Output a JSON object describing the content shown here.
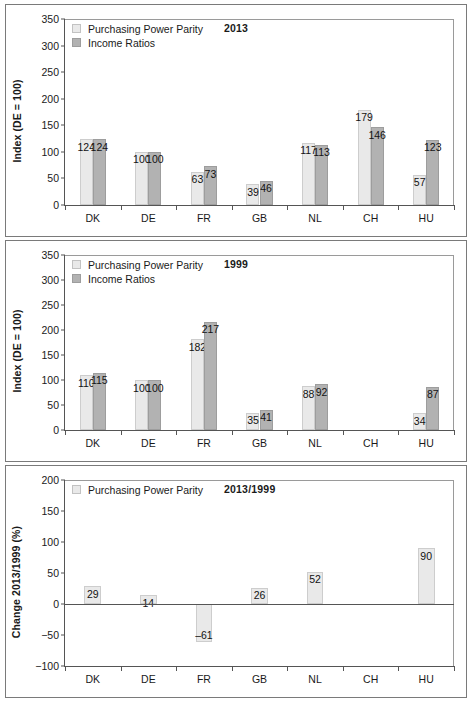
{
  "figure": {
    "panels": [
      {
        "id": "panel-2013",
        "title": "2013",
        "ylabel": "Index (DE = 100)",
        "yticks": [
          "0",
          "50",
          "100",
          "150",
          "200",
          "250",
          "300",
          "350"
        ],
        "legend": [
          {
            "label": "Purchasing Power Parity",
            "swatch": "light",
            "color": "#e9e9e9"
          },
          {
            "label": "Income Ratios",
            "swatch": "dark",
            "color": "#b2b2b2"
          }
        ]
      },
      {
        "id": "panel-1999",
        "title": "1999",
        "ylabel": "Index (DE = 100)",
        "yticks": [
          "0",
          "50",
          "100",
          "150",
          "200",
          "250",
          "300",
          "350"
        ],
        "legend": [
          {
            "label": "Purchasing Power Parity",
            "swatch": "light",
            "color": "#e9e9e9"
          },
          {
            "label": "Income Ratios",
            "swatch": "dark",
            "color": "#b2b2b2"
          }
        ]
      },
      {
        "id": "panel-change",
        "title": "2013/1999",
        "ylabel": "Change 2013/1999 (%)",
        "yticks": [
          "-100",
          "-50",
          "0",
          "50",
          "100",
          "150",
          "200"
        ],
        "legend": [
          {
            "label": "Purchasing Power Parity",
            "swatch": "light",
            "color": "#e9e9e9"
          }
        ]
      }
    ]
  },
  "chart_data": [
    {
      "type": "bar",
      "title": "2013",
      "xlabel": "",
      "ylabel": "Index (DE = 100)",
      "ylim": [
        0,
        350
      ],
      "ytick_step": 50,
      "grid": false,
      "legend_position": "top-left",
      "categories": [
        "DK",
        "DE",
        "FR",
        "GB",
        "NL",
        "CH",
        "HU"
      ],
      "series": [
        {
          "name": "Purchasing Power Parity",
          "color": "#e9e9e9",
          "values": [
            124,
            100,
            63,
            39,
            117,
            179,
            57
          ]
        },
        {
          "name": "Income Ratios",
          "color": "#b2b2b2",
          "values": [
            124,
            100,
            73,
            46,
            113,
            146,
            123
          ]
        }
      ]
    },
    {
      "type": "bar",
      "title": "1999",
      "xlabel": "",
      "ylabel": "Index (DE = 100)",
      "ylim": [
        0,
        350
      ],
      "ytick_step": 50,
      "grid": false,
      "legend_position": "top-left",
      "categories": [
        "DK",
        "DE",
        "FR",
        "GB",
        "NL",
        "CH",
        "HU"
      ],
      "series": [
        {
          "name": "Purchasing Power Parity",
          "color": "#e9e9e9",
          "values": [
            110,
            100,
            182,
            35,
            88,
            null,
            34
          ]
        },
        {
          "name": "Income Ratios",
          "color": "#b2b2b2",
          "values": [
            115,
            100,
            217,
            41,
            92,
            null,
            87
          ]
        }
      ]
    },
    {
      "type": "bar",
      "title": "2013/1999",
      "xlabel": "",
      "ylabel": "Change 2013/1999 (%)",
      "ylim": [
        -100,
        200
      ],
      "ytick_step": 50,
      "grid": false,
      "legend_position": "top-left",
      "categories": [
        "DK",
        "DE",
        "FR",
        "GB",
        "NL",
        "CH",
        "HU"
      ],
      "series": [
        {
          "name": "Purchasing Power Parity",
          "color": "#e9e9e9",
          "values": [
            29,
            14,
            -61,
            26,
            52,
            null,
            90
          ]
        }
      ],
      "data_labels": [
        "29",
        "14",
        "–61",
        "26",
        "52",
        "",
        "90"
      ]
    }
  ]
}
